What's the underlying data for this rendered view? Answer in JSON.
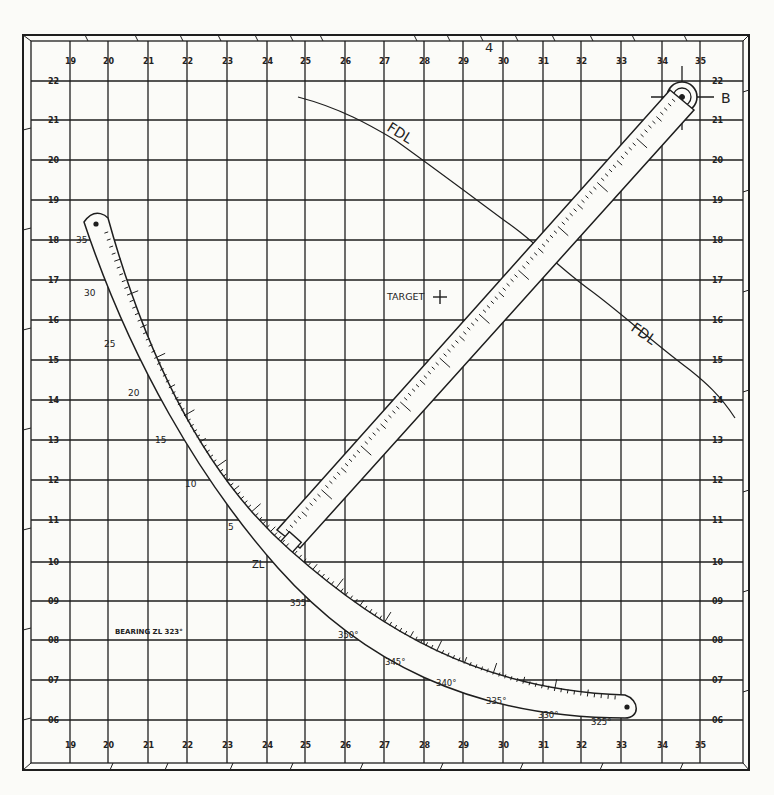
{
  "figure": {
    "sheet_number": "4",
    "x_axis_labels": [
      "19",
      "20",
      "21",
      "22",
      "23",
      "24",
      "25",
      "26",
      "27",
      "28",
      "29",
      "30",
      "31",
      "32",
      "33",
      "34",
      "35"
    ],
    "y_axis_labels": [
      "22",
      "21",
      "20",
      "19",
      "18",
      "17",
      "16",
      "15",
      "14",
      "13",
      "12",
      "11",
      "10",
      "09",
      "08",
      "07",
      "06"
    ],
    "colors": {
      "ink": "#1e1e1e",
      "paper": "#fbfbf8"
    }
  },
  "annotations": {
    "battery_label": "B",
    "target_label": "TARGET",
    "fdl_label_1": "FDL",
    "fdl_label_2": "FDL",
    "zero_line_label": "ZL",
    "bearing_note": "BEARING ZL 323°"
  },
  "deflection_scale": {
    "left_labels": [
      "5",
      "10",
      "15",
      "20",
      "25",
      "30",
      "35"
    ],
    "right_labels": [
      "355°",
      "350°",
      "345°",
      "340°",
      "335°",
      "330°",
      "325°"
    ]
  },
  "icons": {
    "pivot": "crosshair-pivot-icon",
    "target_mark": "plus-icon"
  }
}
